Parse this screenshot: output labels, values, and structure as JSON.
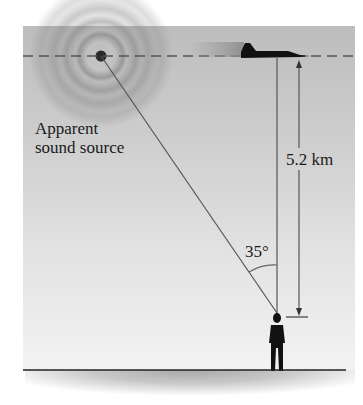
{
  "figure": {
    "labels": {
      "source_line1": "Apparent",
      "source_line2": "sound source",
      "altitude": "5.2 km",
      "angle": "35°"
    },
    "icons": {
      "jet": "jet-aircraft-icon",
      "person": "person-silhouette-icon",
      "source": "concentric-sound-waves-icon"
    },
    "colors": {
      "sky_top": "#bdbdbd",
      "sky_bottom": "#f3f3f3",
      "ink": "#1a1a1a",
      "line": "#555555"
    }
  }
}
